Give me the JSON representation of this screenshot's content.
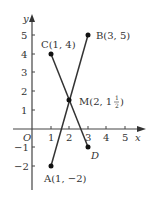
{
  "diagram": {
    "axes": {
      "x_label": "x",
      "y_label": "y",
      "origin_label": "O",
      "x_ticks": [
        "1",
        "2",
        "3",
        "4",
        "5"
      ],
      "y_ticks": [
        "5",
        "4",
        "3",
        "2",
        "1",
        "−1",
        "−2"
      ]
    },
    "points": {
      "A": {
        "label": "A(1, −2)"
      },
      "B": {
        "label": "B(3, 5)"
      },
      "C": {
        "label": "C(1, 4)"
      },
      "D": {
        "label": "D"
      },
      "M": {
        "label_main": "M(2, 1",
        "frac_num": "1",
        "frac_den": "2",
        "label_close": ")"
      }
    }
  }
}
